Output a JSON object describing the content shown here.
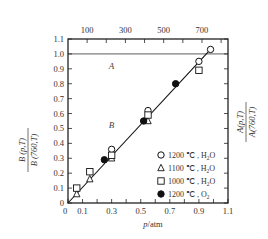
{
  "chart_data": {
    "type": "scatter",
    "title": "",
    "xlabel": "p/atm",
    "ylabel_left": "B(p,T) / B(760,T)",
    "ylabel_right": "A(p,T) / A(760,T)",
    "top_axis_label": "",
    "xlim": [
      0,
      1.1
    ],
    "ylim": [
      0,
      1.1
    ],
    "x_ticks": [
      "0",
      "0.1",
      "0.3",
      "0.5",
      "0.7",
      "0.9",
      "1.1"
    ],
    "y_ticks": [
      "0",
      "0.1",
      "0.2",
      "0.3",
      "0.4",
      "0.5",
      "0.6",
      "0.7",
      "0.8",
      "0.9",
      "1.0",
      "1.1"
    ],
    "top_ticks": [
      "100",
      "300",
      "500",
      "700"
    ],
    "grid": false,
    "reference_line_y": 1.0,
    "region_labels": [
      {
        "text": "A",
        "x": 0.28,
        "y": 0.9
      },
      {
        "text": "B",
        "x": 0.28,
        "y": 0.5
      }
    ],
    "fit_line": {
      "x": [
        0,
        0.98
      ],
      "y": [
        0,
        1.03
      ]
    },
    "legend_position": "lower right",
    "series": [
      {
        "name": "1200 ℃ , H2O",
        "marker": "open-circle",
        "points": [
          [
            0.3,
            0.36
          ],
          [
            0.55,
            0.62
          ],
          [
            0.9,
            0.95
          ],
          [
            0.98,
            1.03
          ]
        ]
      },
      {
        "name": "1100 ℃ , H2O",
        "marker": "open-triangle",
        "points": [
          [
            0.06,
            0.06
          ],
          [
            0.15,
            0.16
          ],
          [
            0.3,
            0.3
          ],
          [
            0.55,
            0.55
          ]
        ]
      },
      {
        "name": "1000 ℃ , H2O",
        "marker": "open-square",
        "points": [
          [
            0.06,
            0.1
          ],
          [
            0.15,
            0.21
          ],
          [
            0.3,
            0.32
          ],
          [
            0.55,
            0.59
          ],
          [
            0.9,
            0.89
          ]
        ]
      },
      {
        "name": "1200 ℃ , O2",
        "marker": "filled-circle",
        "points": [
          [
            0.25,
            0.29
          ],
          [
            0.52,
            0.55
          ],
          [
            0.74,
            0.8
          ]
        ]
      }
    ]
  },
  "labels": {
    "xlabel_p": "p",
    "xlabel_unit": "/atm",
    "left_num": "B (p,T)",
    "left_den": "B (760,T)",
    "right_num": "A(p,T)",
    "right_den": "A(760,T)",
    "region_a": "A",
    "region_b": "B",
    "legend": [
      {
        "temp": "1200 ℃ , H",
        "sub": "2",
        "tail": "O"
      },
      {
        "temp": "1100 ℃ , H",
        "sub": "2",
        "tail": "O"
      },
      {
        "temp": "1000 ℃ , H",
        "sub": "2",
        "tail": "O"
      },
      {
        "temp": "1200 ℃ , O",
        "sub": "2",
        "tail": ""
      }
    ]
  }
}
